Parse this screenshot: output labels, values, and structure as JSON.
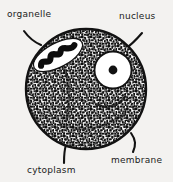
{
  "figure": {
    "style": "black and white stippled line drawing",
    "background_color": "#f3f2f0",
    "ink_color": "#121212"
  },
  "labels": [
    {
      "id": "organelle",
      "text": "organelle",
      "position": "top-left",
      "leader": "curved line from label down-right to upper-left cell edge"
    },
    {
      "id": "nucleus",
      "text": "nucleus",
      "position": "top-right",
      "leader": "curved line from label down-left to upper-right cell edge"
    },
    {
      "id": "membrane",
      "text": "membrane",
      "position": "bottom-right",
      "leader": "curved hook from label up-left to lower-right cell edge"
    },
    {
      "id": "cytoplasm",
      "text": "cytoplasm",
      "position": "bottom-left",
      "leader": "near-vertical line from label up to bottom cell edge"
    }
  ],
  "cell": {
    "shape": "circle",
    "center_x": 86,
    "center_y": 89,
    "radius": 60,
    "fill": "stipple texture (dense black speckle on white)",
    "outline_color": "#121212"
  },
  "organelle": {
    "name": "organelle",
    "shape": "elongated oval",
    "center_x": 58,
    "center_y": 55,
    "rx": 26,
    "ry": 11,
    "rotation_deg": -28,
    "outline_color": "#ffffff",
    "interior": "black wavy zig-zag band (cristae)"
  },
  "nucleus": {
    "name": "nucleus",
    "shape": "circle",
    "center_x": 113,
    "center_y": 70,
    "radius": 18,
    "fill": "#ffffff",
    "outline_color": "#121212",
    "nucleolus": {
      "name": "nucleolus",
      "shape": "dot",
      "center_x": 113,
      "center_y": 70,
      "radius": 4,
      "fill": "#121212"
    }
  }
}
